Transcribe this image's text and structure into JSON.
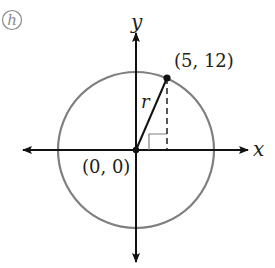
{
  "figure": {
    "panel_label": "h",
    "panel_label_color": "#8a8a8a",
    "axis_color": "#111111",
    "circle_color": "#7f7f7f",
    "axes": {
      "x_label": "x",
      "y_label": "y"
    },
    "origin": {
      "label": "(0, 0)",
      "coords": [
        0,
        0
      ]
    },
    "point": {
      "label": "(5, 12)",
      "coords": [
        5,
        12
      ]
    },
    "radius_label": "r",
    "circle": {
      "center": [
        0,
        0
      ],
      "radius": 13
    },
    "right_angle_marker": true,
    "dashed_vertical_drop": true
  }
}
